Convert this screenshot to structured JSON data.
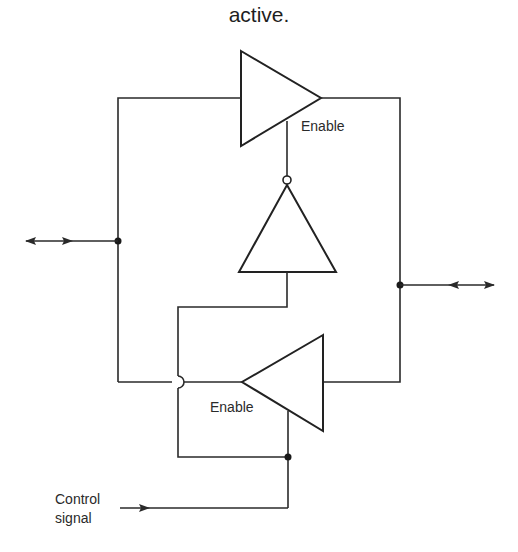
{
  "caption": "active.",
  "labels": {
    "enable_top": "Enable",
    "enable_bottom": "Enable",
    "control_line1": "Control",
    "control_line2": "signal"
  },
  "components": [
    {
      "id": "buffer-top",
      "type": "tri-state buffer",
      "direction": "right",
      "enable": "active-low (via inverter)"
    },
    {
      "id": "inverter",
      "type": "inverter",
      "direction": "up"
    },
    {
      "id": "buffer-bottom",
      "type": "tri-state buffer",
      "direction": "left",
      "enable": "control signal"
    }
  ],
  "terminals": [
    {
      "id": "left-bidirectional",
      "type": "bidirectional arrow"
    },
    {
      "id": "right-bidirectional",
      "type": "bidirectional arrow"
    },
    {
      "id": "control-input",
      "type": "input arrow"
    }
  ]
}
